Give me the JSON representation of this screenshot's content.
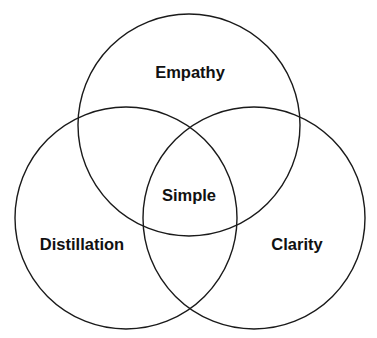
{
  "diagram": {
    "type": "venn",
    "circles": [
      {
        "label": "Empathy",
        "cx": 189,
        "cy": 125,
        "r": 111
      },
      {
        "label": "Distillation",
        "cx": 126,
        "cy": 218,
        "r": 111
      },
      {
        "label": "Clarity",
        "cx": 254,
        "cy": 218,
        "r": 111
      }
    ],
    "intersection_label": "Simple",
    "stroke_color": "#1a1a1a",
    "background": "#ffffff"
  }
}
